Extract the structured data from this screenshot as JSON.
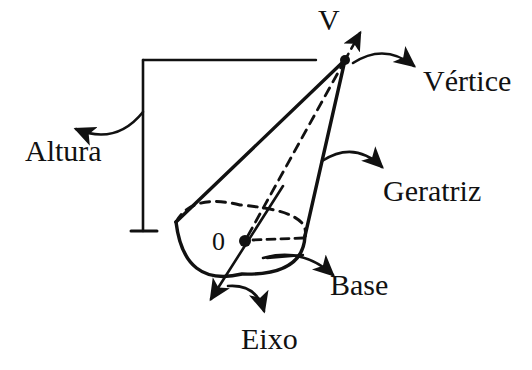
{
  "figure": {
    "title_text": "",
    "language": "pt-BR",
    "background_color": "#ffffff",
    "ink_color": "#111111",
    "width": 532,
    "height": 370
  },
  "labels": {
    "vertex_point": "V",
    "center_point": "0",
    "altura": "Altura",
    "vertice": "Vértice",
    "geratriz": "Geratriz",
    "base": "Base",
    "eixo": "Eixo"
  },
  "geometry": {
    "apex": {
      "x": 345,
      "y": 60
    },
    "center": {
      "x": 245,
      "y": 241
    },
    "base_left": {
      "x": 176,
      "y": 222
    },
    "base_right": {
      "x": 305,
      "y": 236
    },
    "base_bottom": {
      "x": 242,
      "y": 274
    },
    "base_top_dashed": {
      "x": 240,
      "y": 205
    },
    "height_bracket": {
      "top_y": 60,
      "bottom_y": 231,
      "vertical_x": 143,
      "top_right_x": 316,
      "tick_left_x": 131,
      "tick_right_x": 157
    },
    "axis_arrow_tip": {
      "x": 211,
      "y": 299
    },
    "axis_upper_end": {
      "x": 283,
      "y": 186
    },
    "vertex_dashed_arrow_tip": {
      "x": 360,
      "y": 33
    }
  },
  "label_positions": {
    "vertex_point": {
      "x": 318,
      "y": 30
    },
    "center_point": {
      "x": 212,
      "y": 250
    },
    "altura": {
      "x": 25,
      "y": 161
    },
    "vertice": {
      "x": 423,
      "y": 91
    },
    "geratriz": {
      "x": 383,
      "y": 201
    },
    "base": {
      "x": 330,
      "y": 295
    },
    "eixo": {
      "x": 241,
      "y": 349
    }
  },
  "pointer_arrows": [
    {
      "name": "altura-pointer",
      "from": {
        "x": 143,
        "y": 112
      },
      "to": {
        "x": 76,
        "y": 129
      },
      "label": "Altura"
    },
    {
      "name": "vertice-pointer",
      "from": {
        "x": 353,
        "y": 63
      },
      "to": {
        "x": 414,
        "y": 66
      },
      "label": "Vértice"
    },
    {
      "name": "geratriz-pointer",
      "from": {
        "x": 322,
        "y": 161
      },
      "to": {
        "x": 382,
        "y": 167
      },
      "label": "Geratriz"
    },
    {
      "name": "base-pointer",
      "from": {
        "x": 263,
        "y": 258
      },
      "to": {
        "x": 333,
        "y": 275
      },
      "label": "Base"
    },
    {
      "name": "eixo-pointer",
      "from": {
        "x": 228,
        "y": 286
      },
      "to": {
        "x": 264,
        "y": 311
      },
      "label": "Eixo"
    }
  ],
  "strokes": {
    "solid_width": 3.2,
    "thin_width": 2.2,
    "dash_pattern": "9 7",
    "dash_pattern_small": "8 6"
  }
}
